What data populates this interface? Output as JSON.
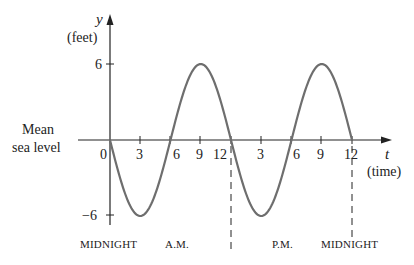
{
  "chart_data": {
    "type": "line",
    "title": "",
    "function": "y = -6 sin(pi t / 6)",
    "xlabel": "t",
    "xlabel_unit": "(time)",
    "ylabel": "y",
    "ylabel_unit": "(feet)",
    "y_ticks": [
      {
        "value": 6,
        "label": "6"
      },
      {
        "value": -6,
        "label": "−6"
      }
    ],
    "x_ticks": [
      {
        "value": 0,
        "label": "0"
      },
      {
        "value": 3,
        "label": "3"
      },
      {
        "value": 6,
        "label": "6"
      },
      {
        "value": 9,
        "label": "9"
      },
      {
        "value": 12,
        "label": "12"
      },
      {
        "value": 15,
        "label": "3"
      },
      {
        "value": 18,
        "label": "6"
      },
      {
        "value": 21,
        "label": "9"
      },
      {
        "value": 24,
        "label": "12"
      }
    ],
    "xlim": [
      0,
      24
    ],
    "ylim": [
      -6,
      6
    ],
    "series": [
      {
        "name": "sea level height",
        "x": [
          0,
          3,
          6,
          9,
          12,
          15,
          18,
          21,
          24
        ],
        "values": [
          0,
          -6,
          0,
          6,
          0,
          -6,
          0,
          6,
          0
        ]
      }
    ],
    "axis_side_label": [
      "Mean",
      "sea level"
    ],
    "dashed_markers": [
      12,
      24
    ],
    "period_labels": [
      {
        "text": "MIDNIGHT",
        "at": 0
      },
      {
        "text": "A.M.",
        "at": 6
      },
      {
        "text": "P.M.",
        "at": 18
      },
      {
        "text": "MIDNIGHT",
        "at": 24
      }
    ],
    "grid": false,
    "legend": "none"
  },
  "labels": {
    "y": "y",
    "y_unit": "(feet)",
    "t": "t",
    "t_unit": "(time)",
    "mean": "Mean",
    "sea_level": "sea level",
    "midnight_left": "MIDNIGHT",
    "am": "A.M.",
    "pm": "P.M.",
    "midnight_right": "MIDNIGHT"
  },
  "ticks": {
    "y_pos": "6",
    "y_neg": "−6",
    "x0": "0",
    "x3": "3",
    "x6": "6",
    "x9": "9",
    "x12": "12",
    "x15": "3",
    "x18": "6",
    "x21": "9",
    "x24": "12"
  },
  "colors": {
    "axis": "#222222",
    "curve": "#6e6e6e",
    "text": "#222222"
  }
}
